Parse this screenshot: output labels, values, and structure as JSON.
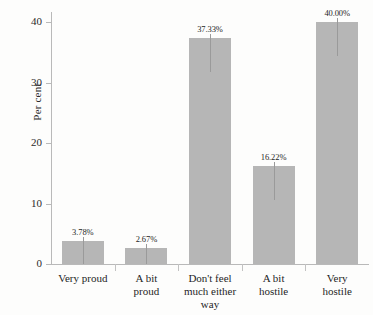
{
  "chart_data": {
    "type": "bar",
    "title": "",
    "xlabel": "",
    "ylabel": "Per cent",
    "ylim": [
      0,
      42
    ],
    "grid": false,
    "legend": null,
    "ytick_labels": [
      "0",
      "10",
      "20",
      "30",
      "40"
    ],
    "ytick_values": [
      0,
      10,
      20,
      30,
      40
    ],
    "categories": [
      "Very proud",
      "A bit proud",
      "Don't feel much either way",
      "A bit hostile",
      "Very hostile"
    ],
    "values": [
      3.78,
      2.67,
      37.33,
      16.22,
      40.0
    ],
    "data_labels": [
      "3.78%",
      "2.67%",
      "37.33%",
      "16.22%",
      "40.00%"
    ],
    "bar_color": "#b6b6b6",
    "axis_color": "#b9b9b9",
    "background_color": "#fdfdfc"
  },
  "axis": {
    "y_label": "Per cent",
    "ticks": [
      {
        "label": "40",
        "value": 40
      },
      {
        "label": "30",
        "value": 30
      },
      {
        "label": "20",
        "value": 20
      },
      {
        "label": "10",
        "value": 10
      },
      {
        "label": "0",
        "value": 0
      }
    ]
  },
  "categories": [
    {
      "lines": [
        "Very proud"
      ],
      "label": "Very proud",
      "value_label": "3.78%"
    },
    {
      "lines": [
        "A bit",
        "proud"
      ],
      "label": "A bit proud",
      "value_label": "2.67%"
    },
    {
      "lines": [
        "Don't feel",
        "much either",
        "way"
      ],
      "label": "Don't feel much either way",
      "value_label": "37.33%"
    },
    {
      "lines": [
        "A bit",
        "hostile"
      ],
      "label": "A bit hostile",
      "value_label": "16.22%"
    },
    {
      "lines": [
        "Very hostile"
      ],
      "label": "Very hostile",
      "value_label": "40.00%"
    }
  ]
}
